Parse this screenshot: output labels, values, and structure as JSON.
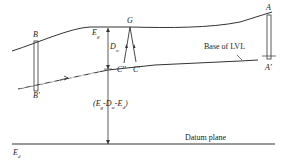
{
  "diagram": {
    "points": {
      "A": "A",
      "A_prime": "A'",
      "B": "B",
      "B_prime": "B'",
      "G": "G",
      "C_prime": "C'",
      "C_double_prime": "C''"
    },
    "labels": {
      "Eg": "E",
      "Eg_sub": "g",
      "Dw": "D",
      "Dw_sub": "w",
      "Ed": "E",
      "Ed_sub": "d",
      "expression": "(E₉-Dᵥ-Eₐ)",
      "expression_parts": [
        "(E",
        "g",
        "-D",
        "w",
        "-E",
        "d",
        ")"
      ],
      "base_of_lvl": "Base of LVL",
      "datum_plane": "Datum plane"
    },
    "colors": {
      "line": "#333333",
      "background": "#ffffff"
    }
  }
}
